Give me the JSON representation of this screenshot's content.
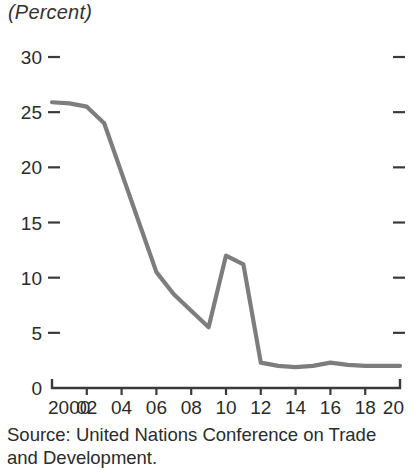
{
  "chart_data": {
    "type": "line",
    "title": "(Percent)",
    "subtitle": "",
    "xlabel": "",
    "ylabel": "",
    "ylim": [
      0,
      30
    ],
    "xlim": [
      2000,
      2020
    ],
    "y_ticks": [
      0,
      5,
      10,
      15,
      20,
      25,
      30
    ],
    "y_tick_labels": [
      "0",
      "5",
      "10",
      "15",
      "20",
      "25",
      "30"
    ],
    "x_ticks": [
      2000,
      2002,
      2004,
      2006,
      2008,
      2010,
      2012,
      2014,
      2016,
      2018,
      2020
    ],
    "x_tick_labels": [
      "2000",
      "02",
      "04",
      "06",
      "08",
      "10",
      "12",
      "14",
      "16",
      "18",
      "20"
    ],
    "grid": false,
    "legend": false,
    "legend_position": "none",
    "right_axis_ticks": true,
    "line_color": "#7d7d7d",
    "axis_color": "#3a3a3a",
    "x": [
      2000,
      2001,
      2002,
      2003,
      2004,
      2005,
      2006,
      2007,
      2008,
      2009,
      2010,
      2011,
      2012,
      2013,
      2014,
      2015,
      2016,
      2017,
      2018,
      2019,
      2020
    ],
    "values": [
      25.9,
      25.8,
      25.5,
      24.0,
      19.5,
      15.0,
      10.5,
      8.5,
      7.0,
      5.5,
      12.0,
      11.2,
      2.3,
      2.0,
      1.9,
      2.0,
      2.3,
      2.1,
      2.0,
      2.0,
      2.0
    ],
    "series": [
      {
        "name": "",
        "values": [
          25.9,
          25.8,
          25.5,
          24.0,
          19.5,
          15.0,
          10.5,
          8.5,
          7.0,
          5.5,
          12.0,
          11.2,
          2.3,
          2.0,
          1.9,
          2.0,
          2.3,
          2.1,
          2.0,
          2.0,
          2.0
        ]
      }
    ],
    "annotations": []
  },
  "source": {
    "text": "Source: United Nations Conference on Trade\nand Development."
  }
}
